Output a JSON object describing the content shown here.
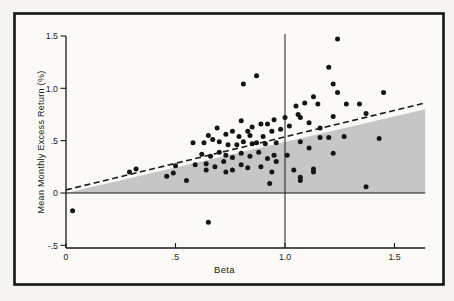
{
  "figure": {
    "background": "#f5f4f0",
    "frame_color": "#151515",
    "shade_color": "#c6c6c6",
    "dot_color": "#151515",
    "line_color": "#1a1a1a"
  },
  "chart_data": {
    "type": "scatter",
    "title": "",
    "xlabel": "Beta",
    "ylabel": "Mean Monthly Excess Return (%)",
    "xlim": [
      0,
      1.64
    ],
    "ylim": [
      -0.525,
      1.52
    ],
    "grid": false,
    "legend": "none",
    "x_ticks": [
      {
        "value": 0,
        "label": "0"
      },
      {
        "value": 0.5,
        "label": ".5"
      },
      {
        "value": 1.0,
        "label": "1.0"
      },
      {
        "value": 1.5,
        "label": "1.5"
      }
    ],
    "y_ticks": [
      {
        "value": 1.5,
        "label": "1.5"
      },
      {
        "value": 1.0,
        "label": "1.0"
      },
      {
        "value": 0.5,
        "label": ".5"
      },
      {
        "value": 0,
        "label": "0"
      },
      {
        "value": -0.5,
        "label": "-.5"
      }
    ],
    "zero_line_y": 0,
    "vertical_marker_x": 1.0,
    "market_line_dashed": {
      "x1": 0,
      "y1": 0.03,
      "x2": 1.64,
      "y2": 0.86
    },
    "shaded_region": [
      [
        0,
        0
      ],
      [
        1.64,
        0.8
      ],
      [
        1.64,
        0
      ]
    ],
    "points": [
      [
        1.24,
        1.47
      ],
      [
        1.2,
        1.2
      ],
      [
        0.87,
        1.12
      ],
      [
        0.81,
        1.04
      ],
      [
        1.22,
        1.04
      ],
      [
        1.24,
        0.96
      ],
      [
        1.13,
        0.92
      ],
      [
        1.45,
        0.96
      ],
      [
        1.09,
        0.86
      ],
      [
        1.05,
        0.83
      ],
      [
        1.15,
        0.85
      ],
      [
        1.28,
        0.85
      ],
      [
        1.34,
        0.85
      ],
      [
        1.37,
        0.76
      ],
      [
        1.06,
        0.75
      ],
      [
        1.0,
        0.72
      ],
      [
        1.07,
        0.72
      ],
      [
        1.22,
        0.73
      ],
      [
        0.95,
        0.7
      ],
      [
        0.8,
        0.69
      ],
      [
        0.92,
        0.66
      ],
      [
        0.89,
        0.66
      ],
      [
        1.11,
        0.67
      ],
      [
        0.69,
        0.62
      ],
      [
        1.16,
        0.62
      ],
      [
        1.02,
        0.64
      ],
      [
        0.98,
        0.61
      ],
      [
        0.85,
        0.63
      ],
      [
        1.27,
        0.54
      ],
      [
        1.43,
        0.52
      ],
      [
        1.16,
        0.53
      ],
      [
        1.2,
        0.53
      ],
      [
        1.22,
        0.38
      ],
      [
        1.13,
        0.23
      ],
      [
        1.07,
        0.15
      ],
      [
        1.37,
        0.06
      ],
      [
        0.03,
        -0.17
      ],
      [
        0.65,
        -0.28
      ],
      [
        0.29,
        0.2
      ],
      [
        0.32,
        0.23
      ],
      [
        0.5,
        0.26
      ],
      [
        0.46,
        0.16
      ],
      [
        0.49,
        0.19
      ],
      [
        0.55,
        0.12
      ],
      [
        0.65,
        0.55
      ],
      [
        0.73,
        0.56
      ],
      [
        0.76,
        0.59
      ],
      [
        0.79,
        0.54
      ],
      [
        0.83,
        0.59
      ],
      [
        0.84,
        0.55
      ],
      [
        0.9,
        0.54
      ],
      [
        0.94,
        0.59
      ],
      [
        1.07,
        0.49
      ],
      [
        0.58,
        0.48
      ],
      [
        0.63,
        0.48
      ],
      [
        0.67,
        0.51
      ],
      [
        0.7,
        0.49
      ],
      [
        0.74,
        0.46
      ],
      [
        0.78,
        0.46
      ],
      [
        0.81,
        0.49
      ],
      [
        0.85,
        0.47
      ],
      [
        0.87,
        0.48
      ],
      [
        0.91,
        0.47
      ],
      [
        0.96,
        0.48
      ],
      [
        1.11,
        0.43
      ],
      [
        0.62,
        0.37
      ],
      [
        0.66,
        0.35
      ],
      [
        0.7,
        0.39
      ],
      [
        0.73,
        0.36
      ],
      [
        0.76,
        0.34
      ],
      [
        0.8,
        0.38
      ],
      [
        0.84,
        0.35
      ],
      [
        0.88,
        0.39
      ],
      [
        0.92,
        0.33
      ],
      [
        0.95,
        0.36
      ],
      [
        1.01,
        0.36
      ],
      [
        0.64,
        0.28
      ],
      [
        0.68,
        0.25
      ],
      [
        0.72,
        0.3
      ],
      [
        0.73,
        0.2
      ],
      [
        0.76,
        0.22
      ],
      [
        0.8,
        0.27
      ],
      [
        0.83,
        0.24
      ],
      [
        0.89,
        0.25
      ],
      [
        0.94,
        0.2
      ],
      [
        0.59,
        0.27
      ],
      [
        0.64,
        0.22
      ],
      [
        1.04,
        0.22
      ],
      [
        1.13,
        0.2
      ],
      [
        0.96,
        0.3
      ],
      [
        0.93,
        0.09
      ],
      [
        1.07,
        0.12
      ]
    ]
  }
}
